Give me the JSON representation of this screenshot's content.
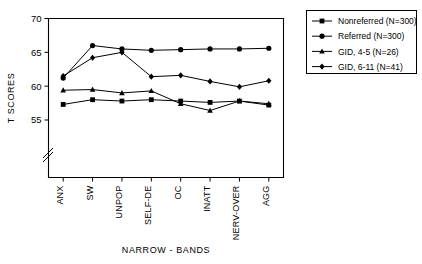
{
  "chart_data": {
    "type": "line",
    "title": "",
    "xlabel": "NARROW - BANDS",
    "ylabel": "T SCORES",
    "categories": [
      "ANX",
      "SW",
      "UNPOP",
      "SELF-DE",
      "OC",
      "INATT",
      "NERV-OVER",
      "AGG"
    ],
    "ylim": [
      54,
      70
    ],
    "yticks": [
      55,
      60,
      65,
      70
    ],
    "ytick_labels": [
      "55",
      "60",
      "65",
      "70"
    ],
    "axis_break": true,
    "grid": false,
    "legend_position": "top-right",
    "series": [
      {
        "name": "Nonreferred (N=300)",
        "marker": "square",
        "values": [
          57.3,
          58.0,
          57.8,
          58.0,
          57.8,
          57.6,
          57.8,
          57.2
        ]
      },
      {
        "name": "Referred (N=300)",
        "marker": "circle",
        "values": [
          61.2,
          66.0,
          65.5,
          65.3,
          65.4,
          65.5,
          65.5,
          65.6
        ]
      },
      {
        "name": "GID, 4-5 (N=26)",
        "marker": "triangle",
        "values": [
          59.4,
          59.5,
          59.0,
          59.3,
          57.4,
          56.4,
          57.8,
          57.4
        ]
      },
      {
        "name": "GID, 6-11 (N=41)",
        "marker": "diamond",
        "values": [
          61.5,
          64.2,
          65.0,
          61.4,
          61.6,
          60.7,
          59.9,
          60.8
        ]
      }
    ]
  },
  "legend": {
    "items": [
      {
        "label": "Nonreferred (N=300)",
        "marker": "square"
      },
      {
        "label": "Referred (N=300)",
        "marker": "circle"
      },
      {
        "label": "GID, 4-5 (N=26)",
        "marker": "triangle"
      },
      {
        "label": "GID, 6-11 (N=41)",
        "marker": "diamond"
      }
    ]
  },
  "colors": {
    "ink": "#000000",
    "background": "#ffffff"
  }
}
